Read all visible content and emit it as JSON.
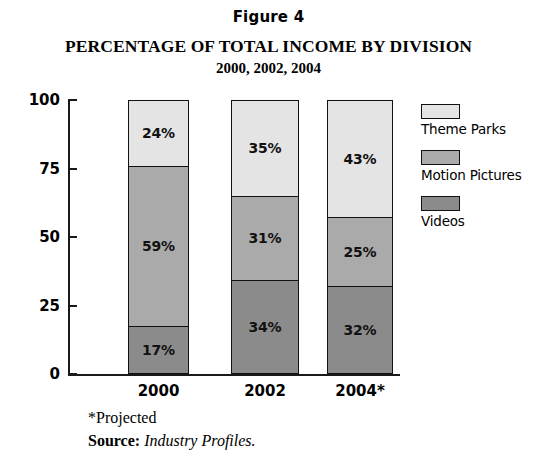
{
  "figure_label": "Figure 4",
  "title": "PERCENTAGE OF TOTAL INCOME BY DIVISION",
  "subtitle": "2000, 2002, 2004",
  "footnotes": {
    "projected": "*Projected",
    "source_prefix": "Source:",
    "source_name": "Industry Profiles."
  },
  "legend": {
    "items": [
      {
        "label": "Theme Parks",
        "color": "#e4e4e4"
      },
      {
        "label": "Motion Pictures",
        "color": "#aaaaaa"
      },
      {
        "label": "Videos",
        "color": "#8b8b8b"
      }
    ]
  },
  "chart_data": {
    "type": "bar",
    "subtype": "stacked-100",
    "title": "PERCENTAGE OF TOTAL INCOME BY DIVISION",
    "subtitle": "2000, 2002, 2004",
    "figure_label": "Figure 4",
    "xlabel": "",
    "ylabel": "",
    "ylim": [
      0,
      100
    ],
    "yticks": [
      0,
      25,
      50,
      75,
      100
    ],
    "ytick_labels": [
      "0",
      "25",
      "50",
      "75",
      "100"
    ],
    "grid": false,
    "legend_position": "right",
    "categories": [
      "2000",
      "2002",
      "2004*"
    ],
    "series": [
      {
        "name": "Theme Parks",
        "color": "#e4e4e4",
        "values": [
          24,
          35,
          43
        ],
        "labels": [
          "24%",
          "35%",
          "43%"
        ]
      },
      {
        "name": "Motion Pictures",
        "color": "#aaaaaa",
        "values": [
          59,
          31,
          25
        ],
        "labels": [
          "59%",
          "31%",
          "25%"
        ]
      },
      {
        "name": "Videos",
        "color": "#8b8b8b",
        "values": [
          17,
          34,
          32
        ],
        "labels": [
          "17%",
          "34%",
          "32%"
        ]
      }
    ],
    "annotations": [
      "*Projected",
      "Source: Industry Profiles."
    ]
  }
}
